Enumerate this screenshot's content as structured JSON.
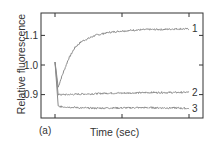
{
  "chart_data": {
    "type": "line",
    "title": "",
    "panel_label": "(a)",
    "xlabel": "Time (sec)",
    "ylabel": "Relative fluorescence",
    "y_ticks": [
      "1.1",
      "1.0",
      "0.9"
    ],
    "y_tick_values": [
      1.1,
      1.0,
      0.9
    ],
    "ylim": [
      0.83,
      1.18
    ],
    "xlim": [
      0,
      1
    ],
    "x_tick_labels": [],
    "grid": false,
    "legend": "inline labels at right end of curves",
    "series": [
      {
        "name": "1",
        "x": [
          0,
          0.02,
          0.05,
          0.1,
          0.15,
          0.2,
          0.3,
          0.4,
          0.5,
          0.6,
          0.7,
          0.8,
          0.9,
          1.0
        ],
        "values": [
          1.01,
          0.92,
          0.96,
          1.02,
          1.06,
          1.08,
          1.1,
          1.11,
          1.115,
          1.118,
          1.12,
          1.12,
          1.122,
          1.122
        ]
      },
      {
        "name": "2",
        "x": [
          0,
          0.02,
          0.1,
          0.2,
          0.3,
          0.4,
          0.5,
          0.6,
          0.7,
          0.8,
          0.9,
          1.0
        ],
        "values": [
          1.01,
          0.9,
          0.9,
          0.902,
          0.903,
          0.905,
          0.905,
          0.906,
          0.907,
          0.907,
          0.907,
          0.908
        ]
      },
      {
        "name": "3",
        "x": [
          0,
          0.02,
          0.1,
          0.2,
          0.3,
          0.4,
          0.5,
          0.6,
          0.7,
          0.8,
          0.9,
          1.0
        ],
        "values": [
          1.01,
          0.86,
          0.858,
          0.855,
          0.854,
          0.855,
          0.855,
          0.856,
          0.856,
          0.855,
          0.855,
          0.853
        ]
      }
    ],
    "line_color": "#8a8a8a"
  }
}
